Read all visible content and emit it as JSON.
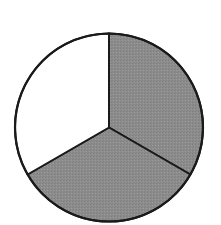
{
  "diagram": {
    "type": "fraction-circle",
    "total_parts": 3,
    "shaded_parts": 2,
    "fraction": "2/3",
    "center": [
      109,
      127.5
    ],
    "radius": 94,
    "colors": {
      "shaded": "#8c8c8c",
      "unshaded": "#ffffff",
      "stroke": "#1a1a1a"
    },
    "segments": [
      {
        "name": "top-right",
        "shaded": true,
        "start_deg": -90,
        "end_deg": 30
      },
      {
        "name": "bottom",
        "shaded": true,
        "start_deg": 30,
        "end_deg": 150
      },
      {
        "name": "top-left",
        "shaded": false,
        "start_deg": 150,
        "end_deg": 270
      }
    ]
  }
}
